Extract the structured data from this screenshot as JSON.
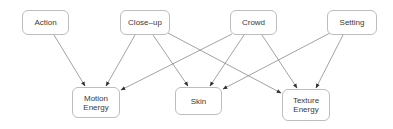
{
  "diagram": {
    "type": "directed-graph",
    "nodes": [
      {
        "id": "action",
        "label": "Action",
        "x": 22,
        "y": 10,
        "w": 47,
        "h": 25
      },
      {
        "id": "closeup",
        "label": "Close–up",
        "x": 120,
        "y": 10,
        "w": 50,
        "h": 25
      },
      {
        "id": "crowd",
        "label": "Crowd",
        "x": 230,
        "y": 10,
        "w": 47,
        "h": 25
      },
      {
        "id": "setting",
        "label": "Setting",
        "x": 327,
        "y": 10,
        "w": 50,
        "h": 25
      },
      {
        "id": "motion",
        "label": "Motion\nEnergy",
        "x": 72,
        "y": 87,
        "w": 48,
        "h": 31
      },
      {
        "id": "skin",
        "label": "Skin",
        "x": 175,
        "y": 87,
        "w": 47,
        "h": 28
      },
      {
        "id": "texture",
        "label": "Texture\nEnergy",
        "x": 282,
        "y": 89,
        "w": 48,
        "h": 32
      }
    ],
    "edges": [
      {
        "from": "action",
        "to": "motion"
      },
      {
        "from": "closeup",
        "to": "motion"
      },
      {
        "from": "closeup",
        "to": "skin"
      },
      {
        "from": "closeup",
        "to": "texture"
      },
      {
        "from": "crowd",
        "to": "motion"
      },
      {
        "from": "crowd",
        "to": "skin"
      },
      {
        "from": "crowd",
        "to": "texture"
      },
      {
        "from": "setting",
        "to": "skin"
      },
      {
        "from": "setting",
        "to": "texture"
      }
    ],
    "colors": {
      "edge": "#8a8a8a",
      "arrow": "#333333",
      "node_border": "#bdbdbd",
      "text": "#3a3a3a"
    }
  },
  "labels": {
    "action": "Action",
    "closeup": "Close–up",
    "crowd": "Crowd",
    "setting": "Setting",
    "motion": "Motion\nEnergy",
    "skin": "Skin",
    "texture": "Texture\nEnergy"
  }
}
